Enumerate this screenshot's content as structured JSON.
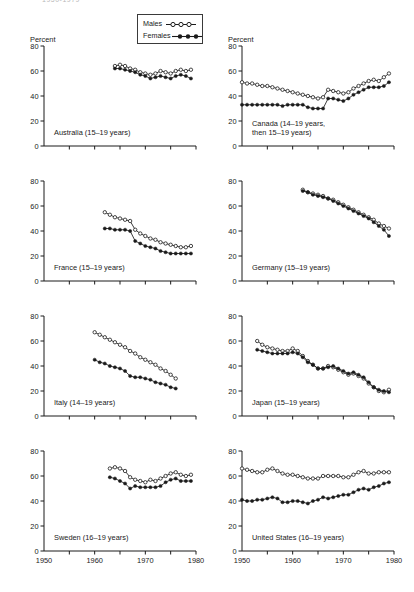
{
  "figure": {
    "cut_title": "1950-1979",
    "percent_label": "Percent"
  },
  "legend": {
    "males_label": "Males",
    "females_label": "Females",
    "males_marker": "open-circle-line",
    "females_marker": "filled-circle-line"
  },
  "axes": {
    "y_ticks": [
      0,
      20,
      40,
      60,
      80
    ],
    "y_tick_labels": [
      "0",
      "20",
      "40",
      "60",
      "80"
    ],
    "x_ticks": [
      1950,
      1955,
      1960,
      1965,
      1970,
      1975,
      1980
    ],
    "x_tick_labels": [
      "1950",
      "1960",
      "1970",
      "1980"
    ],
    "x_labeled_ticks": [
      1950,
      1960,
      1970,
      1980
    ],
    "ylim": [
      0,
      80
    ],
    "xlim": [
      1950,
      1980
    ],
    "grid": false
  },
  "chart_data": {
    "type": "line",
    "title": "1950-1979",
    "xlabel": "",
    "ylabel": "Percent",
    "xlim": [
      1950,
      1980
    ],
    "ylim": [
      0,
      80
    ],
    "grid": false,
    "legend_position": "top-center",
    "legend_entries": [
      "Males",
      "Females"
    ],
    "panels": [
      {
        "id": "australia",
        "caption": "Australia (15–19 years)",
        "show_percent_label": true,
        "series": [
          {
            "name": "Males",
            "marker": "open-circle",
            "x": [
              1964,
              1965,
              1966,
              1967,
              1968,
              1969,
              1970,
              1971,
              1972,
              1973,
              1974,
              1975,
              1976,
              1977,
              1978,
              1979
            ],
            "values": [
              64,
              65,
              64,
              62,
              61,
              59,
              58,
              57,
              58,
              60,
              59,
              58,
              60,
              61,
              60,
              61
            ]
          },
          {
            "name": "Females",
            "marker": "filled-circle",
            "x": [
              1964,
              1965,
              1966,
              1967,
              1968,
              1969,
              1970,
              1971,
              1972,
              1973,
              1974,
              1975,
              1976,
              1977,
              1978,
              1979
            ],
            "values": [
              62,
              62,
              61,
              60,
              59,
              57,
              56,
              54,
              55,
              56,
              55,
              54,
              56,
              57,
              56,
              54
            ]
          }
        ]
      },
      {
        "id": "canada",
        "caption": "Canada (14–19 years, then 15–19 years)",
        "caption_lines": [
          "Canada (14–19 years,",
          "then 15–19 years)"
        ],
        "show_percent_label": true,
        "series": [
          {
            "name": "Males",
            "marker": "open-circle",
            "x": [
              1950,
              1951,
              1952,
              1953,
              1954,
              1955,
              1956,
              1957,
              1958,
              1959,
              1960,
              1961,
              1962,
              1963,
              1964,
              1965,
              1966,
              1967,
              1968,
              1969,
              1970,
              1971,
              1972,
              1973,
              1974,
              1975,
              1976,
              1977,
              1978,
              1979
            ],
            "values": [
              51,
              50,
              50,
              49,
              48,
              48,
              47,
              46,
              45,
              44,
              43,
              42,
              41,
              40,
              39,
              38,
              39,
              45,
              44,
              43,
              42,
              43,
              46,
              48,
              50,
              52,
              53,
              52,
              55,
              58
            ]
          },
          {
            "name": "Females",
            "marker": "filled-circle",
            "x": [
              1950,
              1951,
              1952,
              1953,
              1954,
              1955,
              1956,
              1957,
              1958,
              1959,
              1960,
              1961,
              1962,
              1963,
              1964,
              1965,
              1966,
              1967,
              1968,
              1969,
              1970,
              1971,
              1972,
              1973,
              1974,
              1975,
              1976,
              1977,
              1978,
              1979
            ],
            "values": [
              33,
              33,
              33,
              33,
              33,
              33,
              33,
              33,
              32,
              33,
              33,
              33,
              33,
              31,
              30,
              30,
              30,
              38,
              38,
              37,
              36,
              38,
              41,
              43,
              45,
              47,
              47,
              47,
              48,
              51
            ]
          }
        ]
      },
      {
        "id": "france",
        "caption": "France (15–19 years)",
        "show_percent_label": false,
        "series": [
          {
            "name": "Males",
            "marker": "open-circle",
            "x": [
              1962,
              1963,
              1964,
              1965,
              1966,
              1967,
              1968,
              1969,
              1970,
              1971,
              1972,
              1973,
              1974,
              1975,
              1976,
              1977,
              1978,
              1979
            ],
            "values": [
              55,
              53,
              51,
              50,
              49,
              48,
              41,
              38,
              36,
              34,
              33,
              31,
              30,
              29,
              28,
              27,
              27,
              28
            ]
          },
          {
            "name": "Females",
            "marker": "filled-circle",
            "x": [
              1962,
              1963,
              1964,
              1965,
              1966,
              1967,
              1968,
              1969,
              1970,
              1971,
              1972,
              1973,
              1974,
              1975,
              1976,
              1977,
              1978,
              1979
            ],
            "values": [
              42,
              42,
              41,
              41,
              41,
              40,
              32,
              30,
              28,
              27,
              26,
              24,
              23,
              22,
              22,
              22,
              22,
              22
            ]
          }
        ]
      },
      {
        "id": "germany",
        "caption": "Germany (15–19 years)",
        "show_percent_label": false,
        "series": [
          {
            "name": "Males",
            "marker": "open-circle",
            "x": [
              1962,
              1963,
              1964,
              1965,
              1966,
              1967,
              1968,
              1969,
              1970,
              1971,
              1972,
              1973,
              1974,
              1975,
              1976,
              1977,
              1978,
              1979
            ],
            "values": [
              73,
              71,
              70,
              69,
              68,
              66,
              65,
              63,
              61,
              59,
              57,
              55,
              53,
              51,
              49,
              46,
              44,
              42
            ]
          },
          {
            "name": "Females",
            "marker": "filled-circle",
            "x": [
              1962,
              1963,
              1964,
              1965,
              1966,
              1967,
              1968,
              1969,
              1970,
              1971,
              1972,
              1973,
              1974,
              1975,
              1976,
              1977,
              1978,
              1979
            ],
            "values": [
              72,
              71,
              69,
              68,
              67,
              66,
              64,
              62,
              60,
              58,
              56,
              54,
              52,
              50,
              47,
              44,
              41,
              36
            ]
          }
        ]
      },
      {
        "id": "italy",
        "caption": "Italy (14–19 years)",
        "show_percent_label": false,
        "series": [
          {
            "name": "Males",
            "marker": "open-circle",
            "x": [
              1960,
              1961,
              1962,
              1963,
              1964,
              1965,
              1966,
              1967,
              1968,
              1969,
              1970,
              1971,
              1972,
              1973,
              1974,
              1975,
              1976
            ],
            "values": [
              67,
              65,
              63,
              61,
              59,
              57,
              55,
              52,
              50,
              47,
              45,
              43,
              41,
              38,
              36,
              33,
              30
            ]
          },
          {
            "name": "Females",
            "marker": "filled-circle",
            "x": [
              1960,
              1961,
              1962,
              1963,
              1964,
              1965,
              1966,
              1967,
              1968,
              1969,
              1970,
              1971,
              1972,
              1973,
              1974,
              1975,
              1976
            ],
            "values": [
              45,
              43,
              42,
              40,
              39,
              38,
              36,
              32,
              31,
              31,
              30,
              29,
              27,
              26,
              25,
              23,
              22
            ]
          }
        ]
      },
      {
        "id": "japan",
        "caption": "Japan (15–19 years)",
        "show_percent_label": false,
        "series": [
          {
            "name": "Males",
            "marker": "open-circle",
            "x": [
              1953,
              1954,
              1955,
              1956,
              1957,
              1958,
              1959,
              1960,
              1961,
              1962,
              1963,
              1964,
              1965,
              1966,
              1967,
              1968,
              1969,
              1970,
              1971,
              1972,
              1973,
              1974,
              1975,
              1976,
              1977,
              1978,
              1979
            ],
            "values": [
              60,
              57,
              55,
              54,
              53,
              52,
              52,
              54,
              52,
              48,
              44,
              41,
              38,
              38,
              40,
              39,
              37,
              35,
              33,
              34,
              32,
              30,
              26,
              23,
              20,
              19,
              21
            ]
          },
          {
            "name": "Females",
            "marker": "filled-circle",
            "x": [
              1953,
              1954,
              1955,
              1956,
              1957,
              1958,
              1959,
              1960,
              1961,
              1962,
              1963,
              1964,
              1965,
              1966,
              1967,
              1968,
              1969,
              1970,
              1971,
              1972,
              1973,
              1974,
              1975,
              1976,
              1977,
              1978,
              1979
            ],
            "values": [
              53,
              52,
              51,
              50,
              50,
              50,
              50,
              51,
              50,
              47,
              43,
              41,
              38,
              38,
              39,
              40,
              38,
              36,
              34,
              35,
              33,
              31,
              27,
              23,
              21,
              20,
              19
            ]
          }
        ]
      },
      {
        "id": "sweden",
        "caption": "Sweden (16–19 years)",
        "show_percent_label": false,
        "series": [
          {
            "name": "Males",
            "marker": "open-circle",
            "x": [
              1963,
              1964,
              1965,
              1966,
              1967,
              1968,
              1969,
              1970,
              1971,
              1972,
              1973,
              1974,
              1975,
              1976,
              1977,
              1978,
              1979
            ],
            "values": [
              66,
              67,
              66,
              64,
              59,
              57,
              56,
              55,
              57,
              56,
              58,
              60,
              62,
              63,
              61,
              60,
              61
            ]
          },
          {
            "name": "Females",
            "marker": "filled-circle",
            "x": [
              1963,
              1964,
              1965,
              1966,
              1967,
              1968,
              1969,
              1970,
              1971,
              1972,
              1973,
              1974,
              1975,
              1976,
              1977,
              1978,
              1979
            ],
            "values": [
              59,
              58,
              56,
              54,
              50,
              52,
              51,
              51,
              51,
              51,
              52,
              55,
              57,
              58,
              56,
              56,
              56
            ]
          }
        ]
      },
      {
        "id": "united-states",
        "caption": "United States (16–19 years)",
        "show_percent_label": false,
        "series": [
          {
            "name": "Males",
            "marker": "open-circle",
            "x": [
              1950,
              1951,
              1952,
              1953,
              1954,
              1955,
              1956,
              1957,
              1958,
              1959,
              1960,
              1961,
              1962,
              1963,
              1964,
              1965,
              1966,
              1967,
              1968,
              1969,
              1970,
              1971,
              1972,
              1973,
              1974,
              1975,
              1976,
              1977,
              1978,
              1979
            ],
            "values": [
              66,
              65,
              64,
              63,
              63,
              65,
              66,
              64,
              62,
              61,
              61,
              60,
              59,
              58,
              58,
              58,
              60,
              60,
              60,
              60,
              59,
              59,
              61,
              63,
              64,
              62,
              62,
              63,
              63,
              63
            ]
          },
          {
            "name": "Females",
            "marker": "filled-circle",
            "x": [
              1950,
              1951,
              1952,
              1953,
              1954,
              1955,
              1956,
              1957,
              1958,
              1959,
              1960,
              1961,
              1962,
              1963,
              1964,
              1965,
              1966,
              1967,
              1968,
              1969,
              1970,
              1971,
              1972,
              1973,
              1974,
              1975,
              1976,
              1977,
              1978,
              1979
            ],
            "values": [
              41,
              40,
              40,
              41,
              41,
              42,
              43,
              42,
              39,
              39,
              40,
              40,
              39,
              38,
              40,
              41,
              43,
              42,
              43,
              44,
              45,
              45,
              47,
              49,
              50,
              49,
              51,
              52,
              54,
              55
            ]
          }
        ]
      }
    ]
  }
}
